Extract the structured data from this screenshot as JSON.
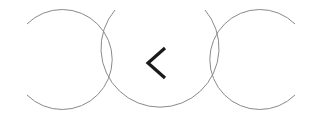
{
  "controls": {
    "back_button": {
      "icon": "chevron-left-icon",
      "label": ""
    }
  },
  "colors": {
    "background": "#ffffff",
    "circle_stroke": "#8a8a8a",
    "chevron": "#1a1a1a"
  }
}
